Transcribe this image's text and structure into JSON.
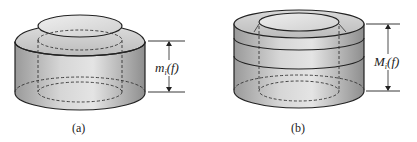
{
  "figures": [
    {
      "id": "a",
      "caption": "(a)",
      "dimension_label": {
        "main": "m",
        "sub": "i",
        "arg": "(f)"
      },
      "description": "Cylinder with raised inner core and convex upper rim"
    },
    {
      "id": "b",
      "caption": "(b)",
      "dimension_label": {
        "main": "M",
        "sub": "i",
        "arg": "(f)"
      },
      "description": "Cylinder with inner core recessed below outer rim"
    }
  ],
  "colors": {
    "stroke": "#222222",
    "fill_light": "#e6e6e6",
    "fill_mid": "#bdbdbd",
    "fill_dark": "#8c8c8c"
  }
}
